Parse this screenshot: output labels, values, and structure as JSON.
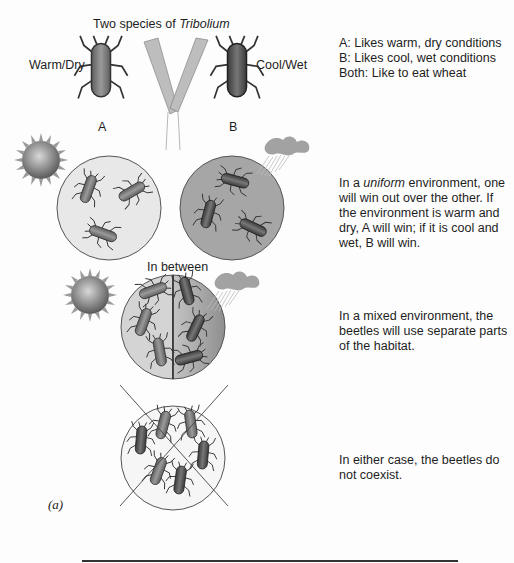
{
  "title": {
    "prefix": "Two species of ",
    "genus": "Tribolium"
  },
  "species": {
    "a": {
      "letter": "A",
      "condition": "Warm/Dry",
      "color": "#7a7a7a"
    },
    "b": {
      "letter": "B",
      "condition": "Cool/Wet",
      "color": "#4e4e4e"
    }
  },
  "key": {
    "line1": "A:  Likes warm, dry conditions",
    "line2": "B:  Likes cool, wet conditions",
    "line3": "Both:  Like to eat wheat"
  },
  "panels": {
    "uniform": {
      "pre": "In a ",
      "emph": "uniform",
      "post": " environment, one will win out over the other.  If the environment is warm and dry, A will win; if it is cool and wet, B will win."
    },
    "in_between_label": "In between",
    "mixed": {
      "text": "In a mixed environment, the beetles will use separate parts of the habitat."
    },
    "coexist": {
      "text": "In either case, the beetles do not coexist."
    }
  },
  "figure_label": "(a)",
  "colors": {
    "warm_habitat": "#e6e6e6",
    "cool_habitat": "#a8a8a8",
    "sun": "#8a8a8a",
    "cloud": "#9c9c9c",
    "wheat": "#b4b4b4",
    "outline": "#333333"
  }
}
